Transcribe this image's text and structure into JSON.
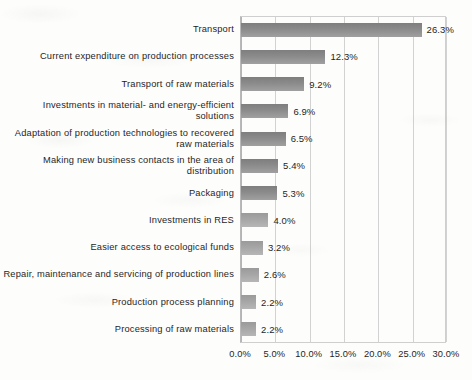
{
  "chart_data": {
    "type": "bar",
    "orientation": "horizontal",
    "title": "",
    "subtitle": "",
    "xlabel": "",
    "ylabel": "",
    "xlim": [
      0,
      30
    ],
    "grid": true,
    "legend": false,
    "legend_position": "none",
    "x_tick_labels": [
      "0.0%",
      "5.0%",
      "10.0%",
      "15.0%",
      "20.0%",
      "25.0%",
      "30.0%"
    ],
    "x_tick_values": [
      0,
      5,
      10,
      15,
      20,
      25,
      30
    ],
    "categories": [
      "Transport",
      "Current expenditure on production processes",
      "Transport of raw materials",
      "Investments in material- and energy-efficient solutions",
      "Adaptation of production technologies to recovered raw materials",
      "Making new business contacts in the area of distribution",
      "Packaging",
      "Investments in RES",
      "Easier access to ecological funds",
      "Repair, maintenance and servicing of production lines",
      "Production process planning",
      "Processing of raw materials"
    ],
    "values": [
      26.3,
      12.3,
      9.2,
      6.9,
      6.5,
      5.4,
      5.3,
      4.0,
      3.2,
      2.6,
      2.2,
      2.2
    ],
    "data_labels": [
      "26.3%",
      "12.3%",
      "9.2%",
      "6.9%",
      "6.5%",
      "5.4%",
      "5.3%",
      "4.0%",
      "3.2%",
      "2.6%",
      "2.2%",
      "2.2%"
    ],
    "series": [
      {
        "name": "",
        "values": [
          26.3,
          12.3,
          9.2,
          6.9,
          6.5,
          5.4,
          5.3,
          4.0,
          3.2,
          2.6,
          2.2,
          2.2
        ]
      }
    ],
    "colors": {
      "bar_dark": "#8b8b8b",
      "bar_light": "#a6a6a6",
      "gridline": "#d2d2d2",
      "axis": "#b4b4b4",
      "text": "#1f1f1f",
      "background": "#fdfdfc"
    }
  }
}
